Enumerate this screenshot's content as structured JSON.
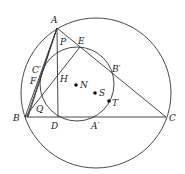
{
  "diagram": {
    "type": "geometry",
    "stroke_color": "#333333",
    "points": {
      "A": {
        "label": "A",
        "x": 57,
        "y": 28,
        "lx": 51,
        "ly": 23
      },
      "B": {
        "label": "B",
        "x": 25,
        "y": 117,
        "lx": 13,
        "ly": 121
      },
      "C": {
        "label": "C",
        "x": 166,
        "y": 117,
        "lx": 169,
        "ly": 121
      },
      "D": {
        "label": "D",
        "x": 58,
        "y": 117,
        "lx": 51,
        "ly": 129
      },
      "E": {
        "label": "E",
        "x": 80,
        "y": 47,
        "lx": 78,
        "ly": 44
      },
      "F": {
        "label": "F",
        "x": 38,
        "y": 80,
        "lx": 30,
        "ly": 84
      },
      "C_prime": {
        "label": "C′",
        "x": 41,
        "y": 70,
        "lx": 32,
        "ly": 73
      },
      "B_prime": {
        "label": "B′",
        "x": 111,
        "y": 71,
        "lx": 112,
        "ly": 72
      },
      "A_prime": {
        "label": "A′",
        "x": 95,
        "y": 117,
        "lx": 91,
        "ly": 129
      },
      "H": {
        "label": "H",
        "x": 58,
        "y": 78,
        "lx": 60,
        "ly": 82
      },
      "P": {
        "label": "P",
        "x": 58,
        "y": 42,
        "lx": 60,
        "ly": 45
      },
      "Q": {
        "label": "Q",
        "x": 42,
        "y": 106,
        "lx": 36,
        "ly": 112
      },
      "N": {
        "label": "N",
        "x": 76,
        "y": 85,
        "lx": 80,
        "ly": 88
      },
      "S": {
        "label": "S",
        "x": 95,
        "y": 93,
        "lx": 99,
        "ly": 96
      },
      "T": {
        "label": "T",
        "x": 109,
        "y": 101,
        "lx": 112,
        "ly": 106
      }
    },
    "circles": {
      "circumcircle": {
        "cx": 96,
        "cy": 93,
        "r": 75
      },
      "nine_point_circle": {
        "cx": 77,
        "cy": 84,
        "r": 37
      }
    },
    "dots": [
      "N",
      "S",
      "T"
    ]
  }
}
